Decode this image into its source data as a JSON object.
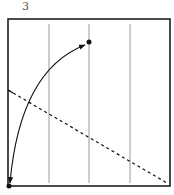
{
  "figure": {
    "label": "3",
    "frame": {
      "x1": 8,
      "y1": 19,
      "x2": 170,
      "y2": 186
    },
    "gridlines_x": [
      49,
      89,
      130
    ],
    "points": [
      {
        "name": "origin",
        "x": 9,
        "y": 186
      },
      {
        "name": "target",
        "x": 89,
        "y": 42
      }
    ],
    "arc": {
      "from": "origin",
      "to": "target",
      "double_headed": true
    },
    "dashed_line": {
      "x1": 8,
      "y1": 90,
      "x2": 167,
      "y2": 183
    },
    "colors": {
      "frame": "#111111",
      "grid": "#999999",
      "ink": "#111111"
    }
  }
}
